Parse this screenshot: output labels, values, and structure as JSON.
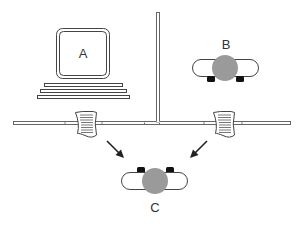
{
  "diagram": {
    "type": "network-diagram",
    "nodes": [
      {
        "id": "A",
        "label": "A",
        "kind": "computer"
      },
      {
        "id": "B",
        "label": "B",
        "kind": "device"
      },
      {
        "id": "C",
        "label": "C",
        "kind": "device"
      }
    ],
    "packets": [
      {
        "id": "packet-left",
        "kind": "document"
      },
      {
        "id": "packet-right",
        "kind": "document"
      }
    ],
    "arrows": [
      {
        "from": "packet-left",
        "to": "C"
      },
      {
        "from": "packet-right",
        "to": "C"
      }
    ],
    "colors": {
      "line": "#555555",
      "device_body": "#9a9a9a",
      "foot": "#111111",
      "background": "#ffffff"
    }
  }
}
